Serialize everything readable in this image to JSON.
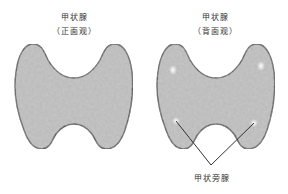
{
  "colors": {
    "gland_fill": "#b9b9b9",
    "gland_outline": "#4a4a4a",
    "highlight": "#ffffff",
    "pointer_line": "#333333",
    "text": "#333333"
  },
  "front_view": {
    "title": "甲状腺",
    "subtitle": "（正面观）"
  },
  "back_view": {
    "title": "甲状腺",
    "subtitle": "（背面观）",
    "callout_label": "甲状旁腺"
  }
}
